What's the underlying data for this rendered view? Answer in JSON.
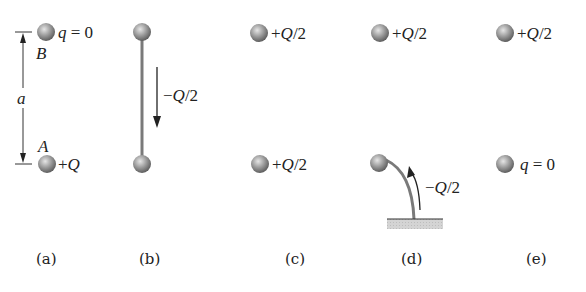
{
  "panels": [
    {
      "caption": "(a)",
      "top": {
        "label": "q = 0",
        "letter": "B"
      },
      "bottom": {
        "label": "+Q",
        "letter": "A"
      },
      "dimension": "a"
    },
    {
      "caption": "(b)",
      "wire_label": "−Q/2",
      "connection": "wire between spheres"
    },
    {
      "caption": "(c)",
      "top": {
        "label": "+Q/2"
      },
      "bottom": {
        "label": "+Q/2"
      }
    },
    {
      "caption": "(d)",
      "top": {
        "label": "+Q/2"
      },
      "ground_label": "−Q/2",
      "connection": "bottom sphere grounded"
    },
    {
      "caption": "(e)",
      "top": {
        "label": "+Q/2"
      },
      "bottom": {
        "label": "q = 0"
      }
    }
  ],
  "colors": {
    "sphere_light": "#d8d8d8",
    "sphere_dark": "#6a6a6a",
    "wire": "#7a7a7a",
    "ground": "#cfcfcf",
    "ink": "#222222"
  }
}
